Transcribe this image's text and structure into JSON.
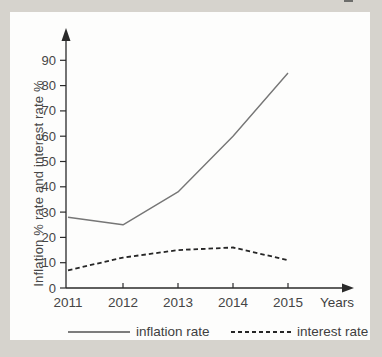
{
  "window": {
    "background_color": "#d6d3cd",
    "panel_background_color": "#fdfdfc"
  },
  "chart_data": {
    "type": "line",
    "categories": [
      "2011",
      "2012",
      "2013",
      "2014",
      "2015"
    ],
    "series": [
      {
        "name": "inflation rate",
        "values": [
          28,
          25,
          38,
          60,
          85
        ],
        "style": "solid",
        "color": "#767676",
        "width": 1.4
      },
      {
        "name": "interest rate",
        "values": [
          7,
          12,
          15,
          16,
          11
        ],
        "style": "dashed",
        "color": "#262626",
        "width": 1.8
      }
    ],
    "xlabel": "Years",
    "ylabel": "Inflation % rate and interest rate %",
    "ylim": [
      0,
      90
    ],
    "yticks": [
      0,
      10,
      20,
      30,
      40,
      50,
      60,
      70,
      80,
      90
    ],
    "grid": false,
    "legend_position": "bottom",
    "axis_color": "#2a2a2a",
    "text_color": "#454545"
  }
}
